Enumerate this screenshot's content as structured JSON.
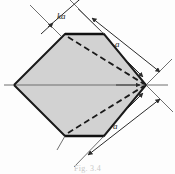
{
  "figure": {
    "type": "engineering-dimension-diagram",
    "caption": "Fig. 3.4",
    "background_color": "#fdfdfd",
    "fill_color": "#d2d2d2",
    "outline_color": "#1a1a1a",
    "dimension_line_color": "#3c3c3c",
    "centerline_color": "#707070",
    "labels": {
      "ka": "ka",
      "a_top": "a",
      "a_bottom": "a"
    },
    "geometry": {
      "left_vertex": [
        14,
        85
      ],
      "right_vertex": [
        146,
        85
      ],
      "top_edge_left": [
        65,
        34
      ],
      "top_edge_right": [
        104,
        34
      ],
      "bottom_edge_left": [
        65,
        136
      ],
      "bottom_edge_right": [
        104,
        136
      ],
      "dashed_upper": [
        [
          68,
          37
        ],
        [
          144,
          85
        ]
      ],
      "dashed_lower": [
        [
          68,
          133
        ],
        [
          144,
          85
        ]
      ]
    },
    "dimensions": [
      {
        "name": "ka",
        "label": "ka",
        "meaning": "truncated-edge-width"
      },
      {
        "name": "a-top",
        "label": "a",
        "meaning": "upper-right-side-length"
      },
      {
        "name": "a-bottom",
        "label": "a",
        "meaning": "lower-right-side-length"
      }
    ]
  }
}
